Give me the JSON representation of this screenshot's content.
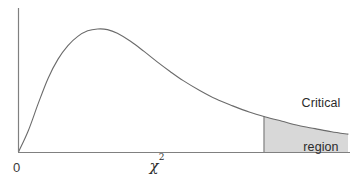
{
  "chart_data": {
    "type": "area",
    "title": "",
    "subtitle": "",
    "xlabel": "χ²",
    "ylabel": "",
    "grid": false,
    "legend_position": "none",
    "axis_color": "#808080",
    "curve_color": "#6b6b6b",
    "fill_color": "#d8d8d8",
    "xlim": [
      0,
      10
    ],
    "ylim": [
      0,
      1
    ],
    "x_tick_labels": [
      "0"
    ],
    "y_tick_labels": [],
    "series": [
      {
        "name": "chi-square density",
        "x": [
          0.0,
          0.3,
          0.6,
          0.9,
          1.2,
          1.5,
          1.8,
          2.1,
          2.4,
          2.7,
          3.0,
          3.4,
          3.8,
          4.2,
          4.6,
          5.0,
          5.5,
          6.0,
          6.5,
          7.0,
          7.5,
          8.0,
          8.5,
          9.0,
          9.5,
          10.0
        ],
        "y": [
          0.0,
          0.175,
          0.395,
          0.6,
          0.755,
          0.865,
          0.94,
          0.985,
          1.0,
          0.995,
          0.965,
          0.9,
          0.82,
          0.735,
          0.655,
          0.58,
          0.5,
          0.43,
          0.375,
          0.325,
          0.285,
          0.25,
          0.215,
          0.19,
          0.165,
          0.145
        ]
      }
    ],
    "shaded_region": {
      "label": "Critical region",
      "x_start": 7.45,
      "x_end": 10.0,
      "fill": "#d8d8d8"
    },
    "annotations": [
      {
        "text": "Critical",
        "role": "critical-region-line-1"
      },
      {
        "text": "region",
        "role": "critical-region-line-2"
      },
      {
        "text": "0",
        "role": "origin-tick"
      }
    ]
  },
  "labels": {
    "critical_region_line1": "Critical",
    "critical_region_line2": "region",
    "origin": "0",
    "x_axis_symbol": "χ",
    "x_axis_exponent": "2"
  }
}
